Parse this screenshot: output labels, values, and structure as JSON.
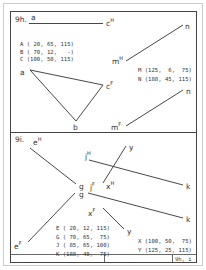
{
  "panels": {
    "top": {
      "title": "9h.",
      "label_a_top": "a",
      "label_cH": "c",
      "label_cH_sup": "H",
      "label_mH": "m",
      "label_mH_sup": "H",
      "label_n_top": "n",
      "coords_left": [
        "A ( 20, 65, 115)",
        "B ( 70, 12,   -)",
        "C (100, 50, 115)"
      ],
      "coords_right": [
        "M (125,  6,  75)",
        "N (188, 45, 115)"
      ],
      "label_a": "a",
      "label_b": "b",
      "label_cF": "c",
      "label_cF_sup": "F",
      "label_mF": "m",
      "label_mF_sup": "F",
      "label_n_bottom": "n"
    },
    "bottom": {
      "title": "9i.",
      "label_eH": "e",
      "label_eH_sup": "H",
      "label_g_top": "g",
      "label_g_bottom": "g",
      "label_eF": "e",
      "label_eF_sup": "F",
      "label_jH": "j",
      "label_jH_sup": "H",
      "label_jF": "j",
      "label_jF_sup": "F",
      "label_xH": "x",
      "label_xH_sup": "H",
      "label_xF": "x",
      "label_xF_sup": "F",
      "label_y_top": "y",
      "label_y_bottom": "y",
      "label_k_top": "k",
      "label_k_bottom": "k",
      "coords_left": [
        "E ( 20, 12, 115)",
        "G ( 70, 65,  75)",
        "J ( 85, 65, 100)",
        "K (188, 40,  75)"
      ],
      "coords_right": [
        "X (100, 50,  75)",
        "Y (125, 25, 115)"
      ]
    }
  },
  "footer": {
    "cell_1": "",
    "cell_2": "",
    "cell_3": "9h, i"
  },
  "colors": {
    "ink": "#333333",
    "outer_border": "#cccccc",
    "background": "#ffffff"
  }
}
